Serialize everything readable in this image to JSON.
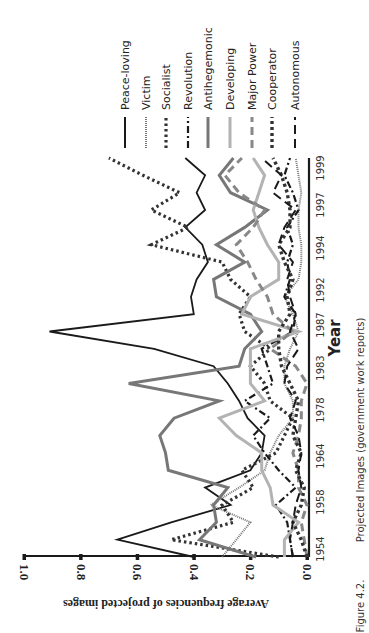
{
  "figure": {
    "caption_number": "Figure 4.2.",
    "caption_text": "Projected Images (government work reports)"
  },
  "chart_data": {
    "type": "line",
    "orientation": "rotated 90° counter-clockwise on page (x-axis runs bottom→top along right edge, y-axis runs right→left along bottom)",
    "title": "Projected Images (government work reports)",
    "xlabel": "Year",
    "ylabel": "Average frequencies of projected images",
    "ylim": [
      0.0,
      1.0
    ],
    "y_ticks": [
      "0.0",
      "0.2",
      "0.4",
      "0.6",
      "0.8",
      "1.0"
    ],
    "x_tick_labels": [
      "1954",
      "1958",
      "1964",
      "1978",
      "1983",
      "1987",
      "1992",
      "1994",
      "1997",
      "1999"
    ],
    "grid": false,
    "legend_position": "top (rotated, right of plot)",
    "x": [
      "1954",
      "1955",
      "1956",
      "1957",
      "1958",
      "1959",
      "1960",
      "1964",
      "1975",
      "1978",
      "1979",
      "1980",
      "1983",
      "1985",
      "1987",
      "1988",
      "1992",
      "1993",
      "1994",
      "1995",
      "1996",
      "1997",
      "1998",
      "1999"
    ],
    "series": [
      {
        "name": "Peace-loving",
        "style": "solid",
        "color": "#1a1a1a",
        "values": [
          0.4,
          0.67,
          0.48,
          0.27,
          0.36,
          0.2,
          0.16,
          0.15,
          0.21,
          0.24,
          0.28,
          0.33,
          0.54,
          0.91,
          0.4,
          0.41,
          0.39,
          0.35,
          0.37,
          0.43,
          0.36,
          0.39,
          0.36,
          0.43
        ]
      },
      {
        "name": "Victim",
        "style": "dotted-fine",
        "color": "#777777",
        "values": [
          0.3,
          0.25,
          0.2,
          0.34,
          0.24,
          0.15,
          0.13,
          0.1,
          0.05,
          0.05,
          0.08,
          0.08,
          0.06,
          0.03,
          0.05,
          0.08,
          0.03,
          0.02,
          0.02,
          0.03,
          0.03,
          0.02,
          0.03,
          0.04
        ]
      },
      {
        "name": "Socialist",
        "style": "dotted-heavy",
        "color": "#333333",
        "values": [
          0.1,
          0.48,
          0.26,
          0.3,
          0.19,
          0.23,
          0.11,
          0.08,
          0.05,
          0.13,
          0.15,
          0.2,
          0.13,
          0.22,
          0.24,
          0.2,
          0.27,
          0.3,
          0.55,
          0.42,
          0.55,
          0.45,
          0.58,
          0.7
        ]
      },
      {
        "name": "Revolution",
        "style": "dash-dot",
        "color": "#1a1a1a",
        "values": [
          0.05,
          0.06,
          0.07,
          0.11,
          0.04,
          0.1,
          0.15,
          0.19,
          0.13,
          0.22,
          0.12,
          0.14,
          0.16,
          0.05,
          0.04,
          0.08,
          0.06,
          0.07,
          0.05,
          0.07,
          0.03,
          0.05,
          0.08,
          0.06
        ]
      },
      {
        "name": "Antihegemonic",
        "style": "solid-thick",
        "color": "#777777",
        "values": [
          0.18,
          0.38,
          0.32,
          0.33,
          0.28,
          0.49,
          0.5,
          0.52,
          0.47,
          0.31,
          0.63,
          0.24,
          0.22,
          0.16,
          0.2,
          0.32,
          0.33,
          0.22,
          0.32,
          0.22,
          0.14,
          0.27,
          0.31,
          0.26
        ]
      },
      {
        "name": "Developing",
        "style": "solid-thick",
        "color": "#b3b3b3",
        "values": [
          0.08,
          0.08,
          0.03,
          0.12,
          0.13,
          0.16,
          0.16,
          0.25,
          0.31,
          0.15,
          0.2,
          0.2,
          0.2,
          0.03,
          0.23,
          0.2,
          0.1,
          0.1,
          0.14,
          0.17,
          0.19,
          0.17,
          0.15,
          0.19
        ]
      },
      {
        "name": "Major Power",
        "style": "dashed-thick",
        "color": "#888888",
        "values": [
          0.0,
          0.01,
          0.02,
          0.0,
          0.03,
          0.03,
          0.05,
          0.03,
          0.02,
          0.02,
          0.0,
          0.04,
          0.13,
          0.05,
          0.12,
          0.14,
          0.18,
          0.21,
          0.25,
          0.19,
          0.15,
          0.24,
          0.29,
          0.23
        ]
      },
      {
        "name": "Cooperator",
        "style": "dotted-square",
        "color": "#333333",
        "values": [
          0.0,
          0.02,
          0.05,
          0.02,
          0.01,
          0.04,
          0.02,
          0.05,
          0.04,
          0.03,
          0.06,
          0.09,
          0.1,
          0.1,
          0.06,
          0.07,
          0.05,
          0.08,
          0.1,
          0.06,
          0.06,
          0.07,
          0.09,
          0.12
        ]
      },
      {
        "name": "Autonomous",
        "style": "dashed-long",
        "color": "#1a1a1a",
        "values": [
          0.05,
          0.06,
          0.05,
          0.04,
          0.02,
          0.03,
          0.02,
          0.03,
          0.06,
          0.04,
          0.08,
          0.07,
          0.03,
          0.06,
          0.04,
          0.06,
          0.07,
          0.05,
          0.1,
          0.08,
          0.04,
          0.12,
          0.09,
          0.16
        ]
      }
    ]
  },
  "legend": {
    "items": [
      {
        "label": "Peace-loving"
      },
      {
        "label": "Victim"
      },
      {
        "label": "Socialist"
      },
      {
        "label": "Revolution"
      },
      {
        "label": "Antihegemonic"
      },
      {
        "label": "Developing"
      },
      {
        "label": "Major Power"
      },
      {
        "label": "Cooperator"
      },
      {
        "label": "Autonomous"
      }
    ]
  },
  "axes": {
    "y_label": "Average frequencies of projected images",
    "x_label": "Year",
    "y_ticks": [
      "0.0",
      "0.2",
      "0.4",
      "0.6",
      "0.8",
      "1.0"
    ],
    "x_ticks": [
      "1954",
      "1958",
      "1964",
      "1978",
      "1983",
      "1987",
      "1992",
      "1994",
      "1997",
      "1999"
    ]
  }
}
